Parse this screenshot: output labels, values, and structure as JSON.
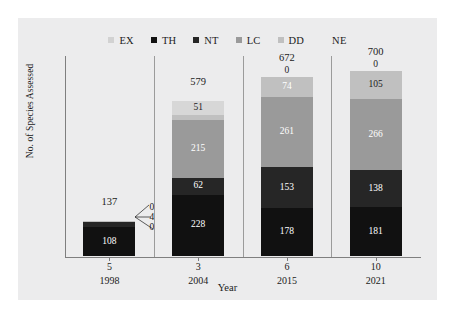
{
  "chart_data": {
    "type": "bar",
    "subtype": "stacked-bar",
    "title": "",
    "xlabel": "Year",
    "ylabel": "No. of Species Assessed",
    "categories": [
      "1998",
      "2004",
      "2015",
      "2021"
    ],
    "category_counts": [
      "5",
      "3",
      "6",
      "10"
    ],
    "totals": [
      137,
      579,
      672,
      700
    ],
    "ylim": [
      0,
      700
    ],
    "grid": false,
    "legend_position": "top",
    "stack_order_bottom_to_top": [
      "TH",
      "NT",
      "LC",
      "DD",
      "EX"
    ],
    "series": [
      {
        "name": "TH",
        "label": "TH",
        "color": "#111111",
        "values": [
          108,
          228,
          178,
          181
        ]
      },
      {
        "name": "NT",
        "label": "NT",
        "color": "#262626",
        "values": [
          20,
          62,
          153,
          138
        ]
      },
      {
        "name": "LC",
        "label": "LC",
        "color": "#9a9a9a",
        "values": [
          0,
          215,
          261,
          266
        ]
      },
      {
        "name": "DD",
        "label": "DD",
        "color": "#c0c0c0",
        "values": [
          4,
          20,
          74,
          105
        ]
      },
      {
        "name": "EX",
        "label": "EX",
        "color": "#d7d7d7",
        "values": [
          0,
          51,
          0,
          0
        ]
      },
      {
        "name": "NE",
        "label": "NE",
        "color": "#f2f2f2",
        "values": [
          5,
          3,
          6,
          10
        ]
      }
    ],
    "bars": [
      {
        "year": "1998",
        "count": "5",
        "total": "137",
        "segments": [
          {
            "series": "TH",
            "value": "108",
            "label_color": "#ffffff",
            "callout": false
          },
          {
            "series": "NT",
            "value": "20",
            "label_color": "#ffffff",
            "callout": false
          },
          {
            "series": "LC",
            "value": "0",
            "label_color": "#1b1b1b",
            "callout": true
          },
          {
            "series": "DD",
            "value": "4",
            "label_color": "#1b1b1b",
            "callout": true
          },
          {
            "series": "EX",
            "value": "0",
            "label_color": "#1b1b1b",
            "callout": true
          }
        ]
      },
      {
        "year": "2004",
        "count": "3",
        "total": "579",
        "segments": [
          {
            "series": "TH",
            "value": "228",
            "label_color": "#ffffff",
            "callout": false
          },
          {
            "series": "NT",
            "value": "62",
            "label_color": "#ffffff",
            "callout": false
          },
          {
            "series": "LC",
            "value": "215",
            "label_color": "#ffffff",
            "callout": false
          },
          {
            "series": "DD",
            "value": "20",
            "label_color": "#1b1b1b",
            "callout": false
          },
          {
            "series": "EX",
            "value": "51",
            "label_color": "#1b1b1b",
            "callout": false
          }
        ]
      },
      {
        "year": "2015",
        "count": "6",
        "total": "672",
        "segments": [
          {
            "series": "TH",
            "value": "178",
            "label_color": "#ffffff",
            "callout": false
          },
          {
            "series": "NT",
            "value": "153",
            "label_color": "#ffffff",
            "callout": false
          },
          {
            "series": "LC",
            "value": "261",
            "label_color": "#ffffff",
            "callout": false
          },
          {
            "series": "DD",
            "value": "74",
            "label_color": "#ffffff",
            "callout": false
          },
          {
            "series": "EX",
            "value": "0",
            "label_color": "#1b1b1b",
            "callout": false
          }
        ]
      },
      {
        "year": "2021",
        "count": "10",
        "total": "700",
        "segments": [
          {
            "series": "TH",
            "value": "181",
            "label_color": "#ffffff",
            "callout": false
          },
          {
            "series": "NT",
            "value": "138",
            "label_color": "#ffffff",
            "callout": false
          },
          {
            "series": "LC",
            "value": "266",
            "label_color": "#ffffff",
            "callout": false
          },
          {
            "series": "DD",
            "value": "105",
            "label_color": "#1b1b1b",
            "callout": false
          },
          {
            "series": "EX",
            "value": "0",
            "label_color": "#1b1b1b",
            "callout": false
          }
        ]
      }
    ]
  },
  "legend": {
    "items": [
      {
        "label": "EX",
        "color": "#d2d2d2"
      },
      {
        "label": "TH",
        "color": "#111111"
      },
      {
        "label": "NT",
        "color": "#262626"
      },
      {
        "label": "LC",
        "color": "#9a9a9a"
      },
      {
        "label": "DD",
        "color": "#c0c0c0"
      },
      {
        "label": "NE",
        "color": "#ececed"
      }
    ]
  },
  "axes": {
    "y_title": "No. of Species Assessed",
    "x_title": "Year",
    "x_count_row": [
      "5",
      "3",
      "6",
      "10"
    ],
    "x_year_row": [
      "1998",
      "2004",
      "2015",
      "2021"
    ]
  },
  "colors": {
    "figure_background": "#ececed",
    "page_background": "#ffffff",
    "axis_line": "#7f7f7f",
    "panel_separator": "#9b9b9b",
    "text": "#1b1b1b",
    "label_light": "#ffffff"
  }
}
